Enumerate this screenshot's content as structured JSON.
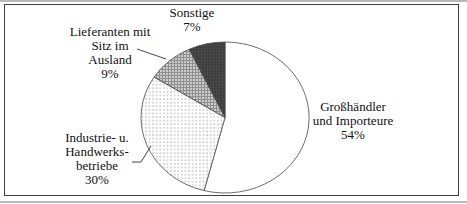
{
  "chart_data": {
    "type": "pie",
    "title": "",
    "legend_position": "none",
    "start_angle_deg": 0,
    "direction": "clockwise",
    "label_style": "outside-callouts",
    "slices": [
      {
        "id": "grosshaendler",
        "label": "Großhändler und Importeure",
        "value": 54,
        "pattern": "plain-white"
      },
      {
        "id": "industrie",
        "label": "Industrie- u. Handwerksbetriebe",
        "value": 30,
        "pattern": "dots"
      },
      {
        "id": "lieferanten",
        "label": "Lieferanten mit Sitz im Ausland",
        "value": 9,
        "pattern": "grid"
      },
      {
        "id": "sonstige",
        "label": "Sonstige",
        "value": 7,
        "pattern": "dark"
      }
    ]
  },
  "labels": {
    "sonstige": {
      "lines": [
        "Sonstige",
        "7%"
      ]
    },
    "lieferanten": {
      "lines": [
        "Lieferanten mit",
        "Sitz im",
        "Ausland",
        "9%"
      ]
    },
    "industrie": {
      "lines": [
        "Industrie- u.",
        "Handwerks-",
        "betriebe",
        "30%"
      ]
    },
    "grosshaendler": {
      "lines": [
        "Großhändler",
        "und Importeure",
        "54%"
      ]
    }
  },
  "colors": {
    "frame_border": "#3f3f3f",
    "slice_outline": "#4a4a4a",
    "slice_white": "#ffffff",
    "slice_dark": "#3d3d3d",
    "slice_dark_texture": "#515151",
    "pattern_dot": "#8a8a8a",
    "pattern_dot_bg": "#ffffff",
    "pattern_grid_bg": "#cbcbcb",
    "pattern_grid_line": "#8f8f8f",
    "text": "#111111"
  }
}
